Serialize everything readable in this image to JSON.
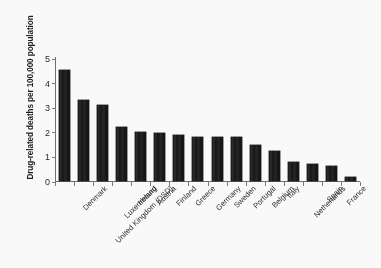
{
  "chart_data": {
    "type": "bar",
    "title": "",
    "subtitle": "",
    "xlabel": "",
    "ylabel": "Drug-related deaths per 100,000 population",
    "ylim": [
      0,
      5
    ],
    "ytick_labels": [
      "0",
      "1",
      "2",
      "3",
      "4",
      "5"
    ],
    "ytick_values": [
      0,
      1,
      2,
      3,
      4,
      5
    ],
    "grid": false,
    "legend": null,
    "legend_position": "none",
    "bar_color": "#131313",
    "axis_color": "#6f6f6f",
    "categories": [
      "Denmark",
      "United Kingdom (DSD)",
      "Luxembourg",
      "Ireland",
      "Austria",
      "Finland",
      "Greece",
      "Germany",
      "Sweden",
      "Portugal",
      "Belgium",
      "Italy",
      "Netherlands",
      "Spain",
      "France"
    ],
    "values": [
      4.55,
      3.35,
      3.15,
      2.25,
      2.05,
      2.0,
      1.9,
      1.85,
      1.85,
      1.85,
      1.52,
      1.25,
      0.83,
      0.72,
      0.67
    ],
    "extra_bars": [
      {
        "label": "",
        "value": 0.22
      }
    ]
  }
}
